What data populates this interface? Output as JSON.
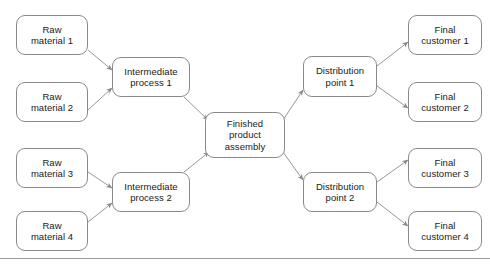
{
  "diagram": {
    "type": "supply-chain-flow",
    "stroke_color": "#8a8a8a",
    "text_color": "#1a1a1a",
    "background": "#ffffff",
    "nodes": [
      {
        "id": "raw1",
        "label": "Raw\nmaterial 1",
        "x": 16,
        "y": 15,
        "w": 72,
        "h": 40
      },
      {
        "id": "raw2",
        "label": "Raw\nmaterial 2",
        "x": 16,
        "y": 82,
        "w": 72,
        "h": 40
      },
      {
        "id": "raw3",
        "label": "Raw\nmaterial 3",
        "x": 16,
        "y": 148,
        "w": 72,
        "h": 40
      },
      {
        "id": "raw4",
        "label": "Raw\nmaterial 4",
        "x": 16,
        "y": 211,
        "w": 72,
        "h": 40
      },
      {
        "id": "int1",
        "label": "Intermediate\nprocess 1",
        "x": 112,
        "y": 57,
        "w": 78,
        "h": 40
      },
      {
        "id": "int2",
        "label": "Intermediate\nprocess 2",
        "x": 112,
        "y": 172,
        "w": 78,
        "h": 40
      },
      {
        "id": "fin",
        "label": "Finished\nproduct\nassembly",
        "x": 205,
        "y": 112,
        "w": 80,
        "h": 46
      },
      {
        "id": "dist1",
        "label": "Distribution\npoint 1",
        "x": 303,
        "y": 56,
        "w": 74,
        "h": 41
      },
      {
        "id": "dist2",
        "label": "Distribution\npoint 2",
        "x": 303,
        "y": 172,
        "w": 74,
        "h": 40
      },
      {
        "id": "cust1",
        "label": "Final\ncustomer 1",
        "x": 408,
        "y": 15,
        "w": 74,
        "h": 40
      },
      {
        "id": "cust2",
        "label": "Final\ncustomer 2",
        "x": 408,
        "y": 82,
        "w": 74,
        "h": 40
      },
      {
        "id": "cust3",
        "label": "Final\ncustomer 3",
        "x": 408,
        "y": 148,
        "w": 74,
        "h": 40
      },
      {
        "id": "cust4",
        "label": "Final\ncustomer 4",
        "x": 408,
        "y": 211,
        "w": 74,
        "h": 40
      }
    ],
    "edges": [
      {
        "from": "raw1",
        "to": "int1",
        "x1": 88,
        "y1": 50,
        "x2": 112,
        "y2": 70
      },
      {
        "from": "raw2",
        "to": "int1",
        "x1": 88,
        "y1": 110,
        "x2": 112,
        "y2": 88
      },
      {
        "from": "raw3",
        "to": "int2",
        "x1": 88,
        "y1": 172,
        "x2": 112,
        "y2": 188
      },
      {
        "from": "raw4",
        "to": "int2",
        "x1": 88,
        "y1": 222,
        "x2": 112,
        "y2": 203
      },
      {
        "from": "int1",
        "to": "fin",
        "x1": 184,
        "y1": 97,
        "x2": 208,
        "y2": 120
      },
      {
        "from": "int2",
        "to": "fin",
        "x1": 184,
        "y1": 172,
        "x2": 209,
        "y2": 152
      },
      {
        "from": "fin",
        "to": "dist1",
        "x1": 283,
        "y1": 120,
        "x2": 303,
        "y2": 90
      },
      {
        "from": "fin",
        "to": "dist2",
        "x1": 283,
        "y1": 152,
        "x2": 303,
        "y2": 180
      },
      {
        "from": "dist1",
        "to": "cust1",
        "x1": 377,
        "y1": 66,
        "x2": 408,
        "y2": 42
      },
      {
        "from": "dist1",
        "to": "cust2",
        "x1": 377,
        "y1": 86,
        "x2": 408,
        "y2": 108
      },
      {
        "from": "dist2",
        "to": "cust3",
        "x1": 377,
        "y1": 182,
        "x2": 408,
        "y2": 160
      },
      {
        "from": "dist2",
        "to": "cust4",
        "x1": 377,
        "y1": 202,
        "x2": 408,
        "y2": 226
      }
    ]
  },
  "footer": {
    "rule_y": 258,
    "caption": ""
  }
}
